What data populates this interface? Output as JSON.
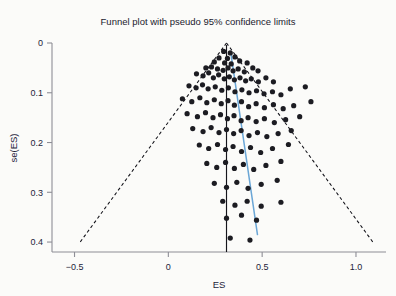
{
  "chart_data": {
    "type": "scatter",
    "title": "Funnel plot with pseudo 95% confidence limits",
    "xlabel": "ES",
    "ylabel": "se(ES)",
    "xlim": [
      -0.62,
      1.16
    ],
    "ylim": [
      0.0,
      0.42
    ],
    "y_inverted": true,
    "grid": false,
    "legend": null,
    "xticks": [
      -0.5,
      0,
      0.5,
      1.0
    ],
    "xticklabels": [
      "-0.5",
      "0",
      "0.5",
      "1.0"
    ],
    "yticks": [
      0,
      0.1,
      0.2,
      0.3,
      0.4
    ],
    "yticklabels": [
      "0",
      "0.1",
      "0.2",
      "0.3",
      "0.4"
    ],
    "annotations": [
      {
        "name": "pooled-effect-line",
        "type": "vline",
        "x": 0.31,
        "style": "solid",
        "color": "#15151c"
      },
      {
        "name": "pseudo-95-ci-left",
        "type": "line",
        "x0": 0.31,
        "y0": 0.0,
        "x1": -0.47,
        "y1": 0.4,
        "style": "dashed",
        "color": "#111118"
      },
      {
        "name": "pseudo-95-ci-right",
        "type": "line",
        "x0": 0.31,
        "y0": 0.0,
        "x1": 1.09,
        "y1": 0.4,
        "style": "dashed",
        "color": "#111118"
      },
      {
        "name": "egger-regression-line",
        "type": "line",
        "x0": 0.335,
        "y0": 0.025,
        "x1": 0.475,
        "y1": 0.385,
        "style": "solid",
        "color": "#6aa6d6"
      }
    ],
    "series": [
      {
        "name": "studies",
        "marker": "circle",
        "color": "#1c1c22",
        "points": [
          [
            0.295,
            0.017
          ],
          [
            0.33,
            0.02
          ],
          [
            0.27,
            0.03
          ],
          [
            0.315,
            0.031
          ],
          [
            0.355,
            0.028
          ],
          [
            0.245,
            0.038
          ],
          [
            0.3,
            0.04
          ],
          [
            0.335,
            0.042
          ],
          [
            0.38,
            0.036
          ],
          [
            0.42,
            0.04
          ],
          [
            0.2,
            0.05
          ],
          [
            0.23,
            0.048
          ],
          [
            0.262,
            0.052
          ],
          [
            0.292,
            0.055
          ],
          [
            0.318,
            0.05
          ],
          [
            0.345,
            0.056
          ],
          [
            0.372,
            0.052
          ],
          [
            0.405,
            0.058
          ],
          [
            0.45,
            0.05
          ],
          [
            0.478,
            0.056
          ],
          [
            0.15,
            0.062
          ],
          [
            0.185,
            0.066
          ],
          [
            0.215,
            0.06
          ],
          [
            0.24,
            0.07
          ],
          [
            0.268,
            0.064
          ],
          [
            0.298,
            0.072
          ],
          [
            0.325,
            0.068
          ],
          [
            0.352,
            0.074
          ],
          [
            0.382,
            0.07
          ],
          [
            0.412,
            0.076
          ],
          [
            0.442,
            0.072
          ],
          [
            0.48,
            0.078
          ],
          [
            0.52,
            0.07
          ],
          [
            0.56,
            0.078
          ],
          [
            0.11,
            0.086
          ],
          [
            0.148,
            0.09
          ],
          [
            0.182,
            0.084
          ],
          [
            0.212,
            0.092
          ],
          [
            0.25,
            0.088
          ],
          [
            0.285,
            0.095
          ],
          [
            0.32,
            0.09
          ],
          [
            0.355,
            0.098
          ],
          [
            0.392,
            0.094
          ],
          [
            0.43,
            0.1
          ],
          [
            0.47,
            0.096
          ],
          [
            0.51,
            0.102
          ],
          [
            0.555,
            0.098
          ],
          [
            0.6,
            0.104
          ],
          [
            0.65,
            0.092
          ],
          [
            0.73,
            0.088
          ],
          [
            0.075,
            0.112
          ],
          [
            0.125,
            0.118
          ],
          [
            0.168,
            0.11
          ],
          [
            0.205,
            0.12
          ],
          [
            0.245,
            0.114
          ],
          [
            0.282,
            0.122
          ],
          [
            0.318,
            0.116
          ],
          [
            0.352,
            0.125
          ],
          [
            0.39,
            0.118
          ],
          [
            0.428,
            0.128
          ],
          [
            0.468,
            0.122
          ],
          [
            0.512,
            0.13
          ],
          [
            0.56,
            0.124
          ],
          [
            0.612,
            0.132
          ],
          [
            0.668,
            0.126
          ],
          [
            0.76,
            0.118
          ],
          [
            0.1,
            0.142
          ],
          [
            0.155,
            0.148
          ],
          [
            0.198,
            0.14
          ],
          [
            0.238,
            0.15
          ],
          [
            0.278,
            0.144
          ],
          [
            0.315,
            0.152
          ],
          [
            0.35,
            0.146
          ],
          [
            0.388,
            0.156
          ],
          [
            0.425,
            0.15
          ],
          [
            0.468,
            0.158
          ],
          [
            0.512,
            0.152
          ],
          [
            0.565,
            0.16
          ],
          [
            0.625,
            0.154
          ],
          [
            0.7,
            0.148
          ],
          [
            0.13,
            0.172
          ],
          [
            0.185,
            0.178
          ],
          [
            0.228,
            0.17
          ],
          [
            0.27,
            0.18
          ],
          [
            0.31,
            0.174
          ],
          [
            0.348,
            0.182
          ],
          [
            0.388,
            0.176
          ],
          [
            0.43,
            0.186
          ],
          [
            0.475,
            0.18
          ],
          [
            0.525,
            0.188
          ],
          [
            0.585,
            0.182
          ],
          [
            0.655,
            0.176
          ],
          [
            0.165,
            0.205
          ],
          [
            0.215,
            0.212
          ],
          [
            0.262,
            0.204
          ],
          [
            0.305,
            0.214
          ],
          [
            0.345,
            0.208
          ],
          [
            0.39,
            0.218
          ],
          [
            0.438,
            0.21
          ],
          [
            0.492,
            0.22
          ],
          [
            0.555,
            0.212
          ],
          [
            0.64,
            0.204
          ],
          [
            0.205,
            0.242
          ],
          [
            0.258,
            0.25
          ],
          [
            0.305,
            0.24
          ],
          [
            0.352,
            0.252
          ],
          [
            0.4,
            0.244
          ],
          [
            0.455,
            0.254
          ],
          [
            0.52,
            0.246
          ],
          [
            0.6,
            0.238
          ],
          [
            0.245,
            0.282
          ],
          [
            0.31,
            0.29
          ],
          [
            0.365,
            0.28
          ],
          [
            0.425,
            0.292
          ],
          [
            0.495,
            0.284
          ],
          [
            0.58,
            0.276
          ],
          [
            0.29,
            0.318
          ],
          [
            0.355,
            0.326
          ],
          [
            0.42,
            0.318
          ],
          [
            0.495,
            0.328
          ],
          [
            0.6,
            0.32
          ],
          [
            0.31,
            0.352
          ],
          [
            0.39,
            0.346
          ],
          [
            0.47,
            0.356
          ],
          [
            0.33,
            0.392
          ],
          [
            0.435,
            0.396
          ]
        ]
      }
    ]
  }
}
